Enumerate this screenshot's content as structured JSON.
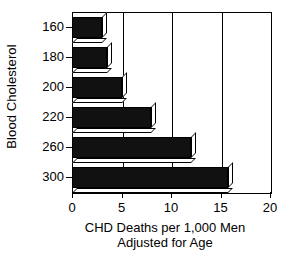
{
  "chart_data": {
    "type": "bar",
    "orientation": "horizontal",
    "title": "",
    "subtitle": "",
    "xlabel": "CHD Deaths per 1,000 Men Adjusted for Age",
    "xlabel_line1": "CHD Deaths per 1,000 Men",
    "xlabel_line2": "Adjusted for Age",
    "ylabel": "Blood Cholesterol",
    "categories": [
      "160",
      "180",
      "200",
      "220",
      "260",
      "300"
    ],
    "values": [
      3.0,
      3.5,
      5.0,
      8.0,
      12.0,
      15.8
    ],
    "xlim": [
      0,
      20
    ],
    "xticks": [
      0,
      5,
      10,
      15,
      20
    ],
    "xtick_labels": [
      "0",
      "5",
      "10",
      "15",
      "20"
    ],
    "grid": true,
    "grid_axis": "x",
    "legend": false,
    "legend_position": "none",
    "bar_style": "3d-extruded",
    "bar_fill_color": "#111111",
    "bar_edge_color": "#000000",
    "bar_side_color": "#ffffff",
    "background_color": "#ffffff",
    "axis_color": "#000000"
  }
}
